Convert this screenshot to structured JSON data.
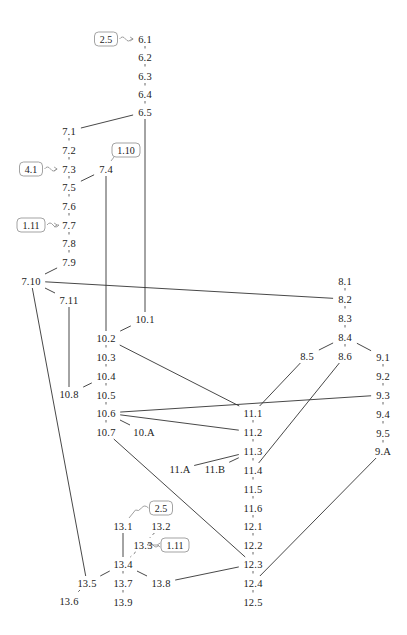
{
  "diagram": {
    "type": "dependency-graph",
    "nodes": [
      {
        "id": "6.1",
        "x": 145,
        "y": 39
      },
      {
        "id": "6.2",
        "x": 145,
        "y": 57
      },
      {
        "id": "6.3",
        "x": 145,
        "y": 76
      },
      {
        "id": "6.4",
        "x": 145,
        "y": 94
      },
      {
        "id": "6.5",
        "x": 145,
        "y": 112
      },
      {
        "id": "7.1",
        "x": 69,
        "y": 131
      },
      {
        "id": "7.2",
        "x": 69,
        "y": 150
      },
      {
        "id": "7.3",
        "x": 69,
        "y": 169
      },
      {
        "id": "7.4",
        "x": 106,
        "y": 169
      },
      {
        "id": "7.5",
        "x": 69,
        "y": 187
      },
      {
        "id": "7.6",
        "x": 69,
        "y": 206
      },
      {
        "id": "7.7",
        "x": 69,
        "y": 225
      },
      {
        "id": "7.8",
        "x": 69,
        "y": 243
      },
      {
        "id": "7.9",
        "x": 69,
        "y": 262
      },
      {
        "id": "7.10",
        "x": 31,
        "y": 281
      },
      {
        "id": "7.11",
        "x": 69,
        "y": 300
      },
      {
        "id": "8.1",
        "x": 345,
        "y": 281
      },
      {
        "id": "8.2",
        "x": 345,
        "y": 299
      },
      {
        "id": "8.3",
        "x": 345,
        "y": 318
      },
      {
        "id": "8.4",
        "x": 345,
        "y": 337
      },
      {
        "id": "8.5",
        "x": 307,
        "y": 356
      },
      {
        "id": "8.6",
        "x": 345,
        "y": 356
      },
      {
        "id": "9.1",
        "x": 383,
        "y": 357
      },
      {
        "id": "9.2",
        "x": 383,
        "y": 376
      },
      {
        "id": "9.3",
        "x": 383,
        "y": 395
      },
      {
        "id": "9.4",
        "x": 383,
        "y": 414
      },
      {
        "id": "9.5",
        "x": 383,
        "y": 433
      },
      {
        "id": "9.A",
        "x": 383,
        "y": 451
      },
      {
        "id": "10.1",
        "x": 145,
        "y": 319
      },
      {
        "id": "10.2",
        "x": 106,
        "y": 338
      },
      {
        "id": "10.3",
        "x": 106,
        "y": 357
      },
      {
        "id": "10.4",
        "x": 106,
        "y": 376
      },
      {
        "id": "10.5",
        "x": 106,
        "y": 395
      },
      {
        "id": "10.6",
        "x": 106,
        "y": 413
      },
      {
        "id": "10.7",
        "x": 106,
        "y": 432
      },
      {
        "id": "10.8",
        "x": 69,
        "y": 394
      },
      {
        "id": "10.A",
        "x": 144,
        "y": 432
      },
      {
        "id": "11.1",
        "x": 253,
        "y": 413
      },
      {
        "id": "11.2",
        "x": 253,
        "y": 432
      },
      {
        "id": "11.3",
        "x": 253,
        "y": 451
      },
      {
        "id": "11.4",
        "x": 253,
        "y": 470
      },
      {
        "id": "11.5",
        "x": 253,
        "y": 489
      },
      {
        "id": "11.6",
        "x": 253,
        "y": 508
      },
      {
        "id": "11.A",
        "x": 180,
        "y": 469
      },
      {
        "id": "11.B",
        "x": 215,
        "y": 469
      },
      {
        "id": "12.1",
        "x": 253,
        "y": 526
      },
      {
        "id": "12.2",
        "x": 253,
        "y": 545
      },
      {
        "id": "12.3",
        "x": 253,
        "y": 564
      },
      {
        "id": "12.4",
        "x": 253,
        "y": 583
      },
      {
        "id": "12.5",
        "x": 253,
        "y": 602
      },
      {
        "id": "13.1",
        "x": 123,
        "y": 526
      },
      {
        "id": "13.2",
        "x": 161,
        "y": 526
      },
      {
        "id": "13.3",
        "x": 143,
        "y": 545
      },
      {
        "id": "13.4",
        "x": 123,
        "y": 564
      },
      {
        "id": "13.5",
        "x": 87,
        "y": 583
      },
      {
        "id": "13.6",
        "x": 69,
        "y": 601
      },
      {
        "id": "13.7",
        "x": 123,
        "y": 583
      },
      {
        "id": "13.8",
        "x": 161,
        "y": 583
      },
      {
        "id": "13.9",
        "x": 123,
        "y": 602
      }
    ],
    "dashed_edges": [
      [
        "6.1",
        "6.2"
      ],
      [
        "6.2",
        "6.3"
      ],
      [
        "6.3",
        "6.4"
      ],
      [
        "6.4",
        "6.5"
      ],
      [
        "7.1",
        "7.2"
      ],
      [
        "7.2",
        "7.3"
      ],
      [
        "7.3",
        "7.5"
      ],
      [
        "7.5",
        "7.6"
      ],
      [
        "7.6",
        "7.7"
      ],
      [
        "7.7",
        "7.8"
      ],
      [
        "7.8",
        "7.9"
      ],
      [
        "8.1",
        "8.2"
      ],
      [
        "8.2",
        "8.3"
      ],
      [
        "8.3",
        "8.4"
      ],
      [
        "8.4",
        "8.6"
      ],
      [
        "9.1",
        "9.2"
      ],
      [
        "9.2",
        "9.3"
      ],
      [
        "9.3",
        "9.4"
      ],
      [
        "9.4",
        "9.5"
      ],
      [
        "9.5",
        "9.A"
      ],
      [
        "10.2",
        "10.3"
      ],
      [
        "10.3",
        "10.4"
      ],
      [
        "10.4",
        "10.5"
      ],
      [
        "10.5",
        "10.6"
      ],
      [
        "10.6",
        "10.7"
      ],
      [
        "11.1",
        "11.2"
      ],
      [
        "11.2",
        "11.3"
      ],
      [
        "11.3",
        "11.4"
      ],
      [
        "11.4",
        "11.5"
      ],
      [
        "11.5",
        "11.6"
      ],
      [
        "11.6",
        "12.1"
      ],
      [
        "12.1",
        "12.2"
      ],
      [
        "12.2",
        "12.3"
      ],
      [
        "12.3",
        "12.4"
      ],
      [
        "12.4",
        "12.5"
      ],
      [
        "13.2",
        "13.3"
      ],
      [
        "13.3",
        "13.4"
      ],
      [
        "13.4",
        "13.7"
      ],
      [
        "13.7",
        "13.9"
      ],
      [
        "13.5",
        "13.6"
      ]
    ],
    "solid_edges": [
      [
        "6.5",
        "7.1"
      ],
      [
        "6.5",
        "10.1"
      ],
      [
        "7.4",
        "7.5"
      ],
      [
        "7.4",
        "10.2"
      ],
      [
        "7.9",
        "7.10"
      ],
      [
        "7.10",
        "7.11"
      ],
      [
        "7.10",
        "8.2"
      ],
      [
        "7.10",
        "13.5"
      ],
      [
        "7.11",
        "10.8"
      ],
      [
        "10.1",
        "10.2"
      ],
      [
        "10.2",
        "11.1"
      ],
      [
        "10.4",
        "10.8"
      ],
      [
        "10.6",
        "9.3"
      ],
      [
        "10.6",
        "11.2"
      ],
      [
        "10.6",
        "10.A"
      ],
      [
        "10.7",
        "12.3"
      ],
      [
        "8.4",
        "8.5"
      ],
      [
        "8.4",
        "9.1"
      ],
      [
        "8.5",
        "11.1"
      ],
      [
        "8.6",
        "11.4"
      ],
      [
        "11.3",
        "11.A"
      ],
      [
        "11.3",
        "11.B"
      ],
      [
        "9.A",
        "12.4"
      ],
      [
        "13.1",
        "13.4"
      ],
      [
        "13.4",
        "13.5"
      ],
      [
        "13.4",
        "13.8"
      ],
      [
        "13.8",
        "12.3"
      ]
    ],
    "references": [
      {
        "label": "2.5",
        "x": 106,
        "y": 39,
        "target": "6.1",
        "dir": "right"
      },
      {
        "label": "1.10",
        "x": 126,
        "y": 150,
        "target": "7.4",
        "dir": "down"
      },
      {
        "label": "4.1",
        "x": 31,
        "y": 169,
        "target": "7.3",
        "dir": "right"
      },
      {
        "label": "1.11",
        "x": 31,
        "y": 225,
        "target": "7.7",
        "dir": "right"
      },
      {
        "label": "2.5",
        "x": 161,
        "y": 508,
        "target": "13.1",
        "dir": "down-left"
      },
      {
        "label": "1.11",
        "x": 175,
        "y": 545,
        "target": "13.3",
        "dir": "left"
      }
    ]
  }
}
